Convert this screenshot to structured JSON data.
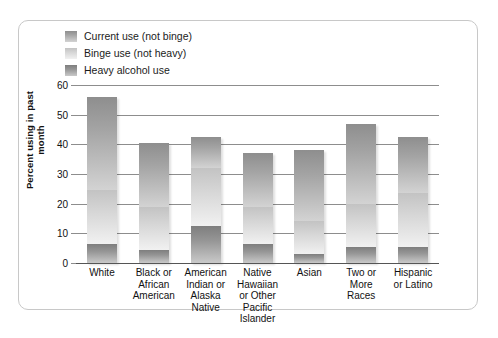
{
  "legend": {
    "items": [
      {
        "label": "Current use (not binge)",
        "key": "current",
        "swatch": "legend-swatch-current"
      },
      {
        "label": "Binge use (not heavy)",
        "key": "binge",
        "swatch": "legend-swatch-binge"
      },
      {
        "label": "Heavy alcohol use",
        "key": "heavy",
        "swatch": "legend-swatch-heavy"
      }
    ]
  },
  "axis": {
    "ylabel": "Percent using in past month",
    "yticks": [
      "60",
      "50",
      "40",
      "30",
      "20",
      "10",
      "0"
    ]
  },
  "chart_data": {
    "type": "bar",
    "stacked": true,
    "title": "",
    "xlabel": "",
    "ylabel": "Percent using in past month",
    "ylim": [
      0,
      60
    ],
    "ytick_values": [
      0,
      10,
      20,
      30,
      40,
      50,
      60
    ],
    "grid": true,
    "legend_position": "top-left",
    "categories": [
      "White",
      "Black or African American",
      "American Indian or Alaska Native",
      "Native Hawaiian or Other Pacific Islander",
      "Asian",
      "Two or More Races",
      "Hispanic or Latino"
    ],
    "category_lines": [
      [
        "White"
      ],
      [
        "Black or",
        "African",
        "American"
      ],
      [
        "American",
        "Indian or",
        "Alaska",
        "Native"
      ],
      [
        "Native",
        "Hawaiian",
        "or Other",
        "Pacific",
        "Islander"
      ],
      [
        "Asian"
      ],
      [
        "Two or",
        "More",
        "Races"
      ],
      [
        "Hispanic",
        "or Latino"
      ]
    ],
    "series": [
      {
        "name": "Heavy alcohol use",
        "values": [
          6.5,
          4.5,
          12.5,
          6.5,
          3.0,
          5.5,
          5.5
        ]
      },
      {
        "name": "Binge use (not heavy)",
        "values": [
          18.0,
          14.5,
          19.5,
          12.5,
          11.0,
          14.5,
          18.0
        ]
      },
      {
        "name": "Current use (not binge)",
        "values": [
          31.5,
          21.5,
          10.5,
          18.0,
          24.0,
          27.0,
          19.0
        ]
      }
    ],
    "cumulative_tops": {
      "heavy": [
        6.5,
        4.5,
        12.5,
        6.5,
        3.0,
        5.5,
        5.5
      ],
      "binge": [
        24.5,
        19.0,
        32.0,
        19.0,
        14.0,
        20.0,
        23.5
      ],
      "total": [
        56.0,
        40.5,
        42.5,
        37.0,
        38.0,
        47.0,
        42.5
      ]
    }
  }
}
